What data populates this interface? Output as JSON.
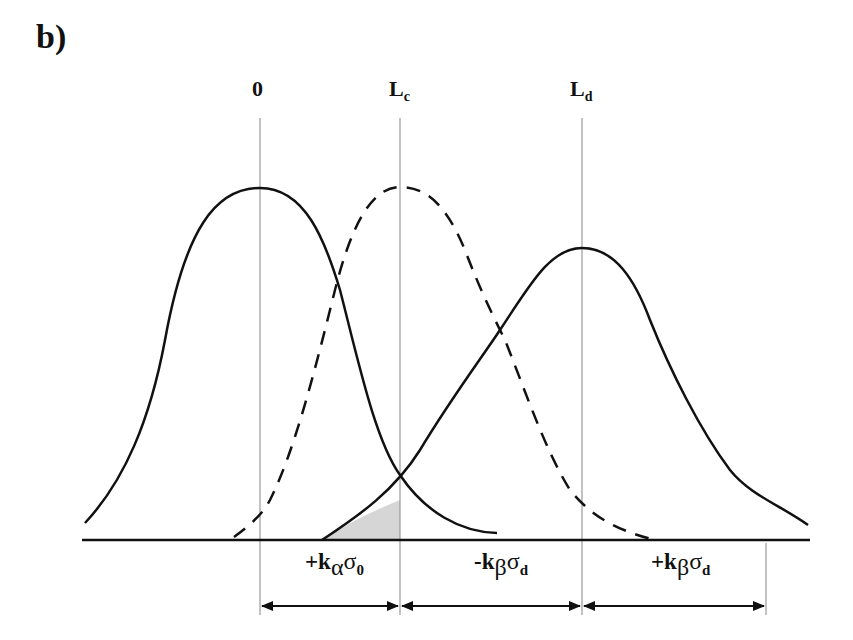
{
  "figure": {
    "panel_label": "b)",
    "markers": [
      {
        "id": "zero",
        "label": "0",
        "sub": "",
        "x": 260
      },
      {
        "id": "lc",
        "label": "L",
        "sub": "c",
        "x": 400
      },
      {
        "id": "ld",
        "label": "L",
        "sub": "d",
        "x": 582
      }
    ],
    "intervals": [
      {
        "sign": "+",
        "k": "k",
        "k_sub": "α",
        "sigma": "σ",
        "sigma_sub": "0",
        "from": "0",
        "to": "Lc"
      },
      {
        "sign": "-",
        "k": "k",
        "k_sub": "β",
        "sigma": "σ",
        "sigma_sub": "d",
        "from": "Lc",
        "to": "Ld"
      },
      {
        "sign": "+",
        "k": "k",
        "k_sub": "β",
        "sigma": "σ",
        "sigma_sub": "d",
        "from": "Ld",
        "to": "end"
      }
    ],
    "curves": [
      {
        "name": "blank-distribution",
        "style": "solid",
        "center": "0"
      },
      {
        "name": "critical-level-distribution",
        "style": "dashed",
        "center": "Lc"
      },
      {
        "name": "detection-limit-distribution",
        "style": "solid",
        "center": "Ld"
      }
    ],
    "shaded_region": "beta error area under Ld curve left of Lc",
    "colors": {
      "ink": "#111111",
      "guide": "#9a9a9a",
      "shade": "#d6d6d6"
    }
  }
}
